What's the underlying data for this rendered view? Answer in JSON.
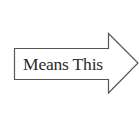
{
  "diagram": {
    "shape": "right-arrow",
    "label": "Means This",
    "stroke_color": "#555555",
    "fill_color": "#ffffff",
    "text_color": "#2a2a2a"
  }
}
